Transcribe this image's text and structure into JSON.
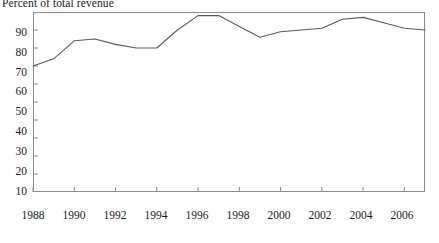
{
  "chart_data": {
    "type": "line",
    "title": "Percent of total revenue",
    "subtitle": "",
    "xlabel": "",
    "ylabel": "",
    "xlim": [
      1988,
      2007
    ],
    "ylim": [
      0,
      100
    ],
    "grid": false,
    "legend": null,
    "legend_position": "none",
    "y_ticks": [
      10,
      20,
      30,
      40,
      50,
      60,
      70,
      80,
      90
    ],
    "y_tick_labels": [
      "10",
      "20",
      "30",
      "40",
      "50",
      "60",
      "70",
      "80",
      "90"
    ],
    "x_ticks": [
      1988,
      1990,
      1992,
      1994,
      1996,
      1998,
      2000,
      2002,
      2004,
      2006
    ],
    "x_tick_labels": [
      "1988",
      "1990",
      "1992",
      "1994",
      "1996",
      "1998",
      "2000",
      "2002",
      "2004",
      "2006"
    ],
    "line_color": "#595959",
    "axis_color": "#8c8c8c",
    "x": [
      1988,
      1989,
      1990,
      1991,
      1992,
      1993,
      1994,
      1995,
      1996,
      1997,
      1998,
      1999,
      2000,
      2001,
      2002,
      2003,
      2004,
      2005,
      2006,
      2007
    ],
    "values": [
      70,
      74,
      84,
      85,
      82,
      80,
      80,
      90,
      98,
      98,
      92,
      86,
      89,
      90,
      91,
      96,
      97,
      94,
      91,
      90
    ],
    "series": [
      {
        "name": "Percent of total revenue",
        "values": [
          70,
          74,
          84,
          85,
          82,
          80,
          80,
          90,
          98,
          98,
          92,
          86,
          89,
          90,
          91,
          96,
          97,
          94,
          91,
          90
        ]
      }
    ],
    "annotations": []
  },
  "axis": {
    "y_labels": [
      "90",
      "80",
      "70",
      "60",
      "50",
      "40",
      "30",
      "20",
      "10"
    ],
    "x_labels": [
      "1988",
      "1990",
      "1992",
      "1994",
      "1996",
      "1998",
      "2000",
      "2002",
      "2004",
      "2006"
    ]
  }
}
